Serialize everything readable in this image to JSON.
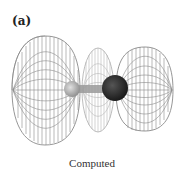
{
  "figure": {
    "panel_label": "(a)",
    "caption": "Computed",
    "colors": {
      "wire": "#8a8a8a",
      "wire_light": "#b5b5b5",
      "small_atom": "#9a9a9a",
      "large_atom": "#1e1e1e",
      "text": "#222222"
    }
  }
}
